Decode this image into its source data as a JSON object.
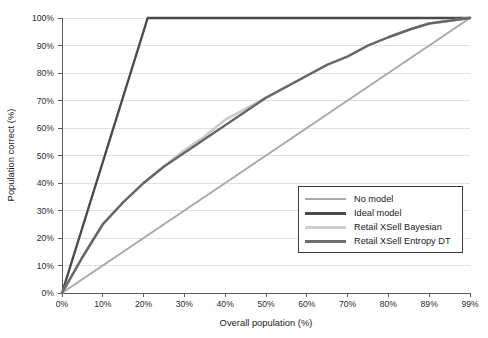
{
  "chart_data": {
    "type": "line",
    "title": "",
    "xlabel": "Overall population (%)",
    "ylabel": "Population correct (%)",
    "xlim": [
      0,
      99
    ],
    "ylim": [
      0,
      100
    ],
    "grid": "horizontal",
    "legend_position": "lower-right",
    "x_tick_labels": [
      "0%",
      "10%",
      "20%",
      "30%",
      "40%",
      "50%",
      "60%",
      "70%",
      "80%",
      "89%",
      "99%"
    ],
    "x_tick_values": [
      0,
      10,
      20,
      30,
      40,
      50,
      60,
      70,
      80,
      89,
      99
    ],
    "y_tick_labels": [
      "0%",
      "10%",
      "20%",
      "30%",
      "40%",
      "50%",
      "60%",
      "70%",
      "80%",
      "90%",
      "100%"
    ],
    "y_tick_values": [
      0,
      10,
      20,
      30,
      40,
      50,
      60,
      70,
      80,
      90,
      100
    ],
    "series": [
      {
        "name": "No model",
        "color": "#a8a8a8",
        "width": 2.0,
        "x": [
          0,
          99
        ],
        "values": [
          0,
          100
        ]
      },
      {
        "name": "Ideal model",
        "color": "#4a4a4a",
        "width": 2.4,
        "x": [
          0,
          21,
          99
        ],
        "values": [
          0,
          100,
          100
        ]
      },
      {
        "name": "Retail XSell Bayesian",
        "color": "#cccccc",
        "width": 2.6,
        "x": [
          0,
          5,
          10,
          15,
          20,
          25,
          30,
          35,
          40,
          45,
          50,
          55,
          60,
          65,
          70,
          75,
          80,
          85,
          89,
          94,
          99
        ],
        "values": [
          0,
          13,
          25,
          33,
          40,
          46,
          52,
          57,
          63,
          67,
          71,
          75,
          79,
          83,
          86,
          90,
          93,
          96,
          98,
          99,
          100
        ]
      },
      {
        "name": "Retail XSell Entropy DT",
        "color": "#666666",
        "width": 2.4,
        "x": [
          0,
          5,
          10,
          15,
          20,
          25,
          30,
          35,
          40,
          45,
          50,
          55,
          60,
          65,
          70,
          75,
          80,
          85,
          89,
          94,
          99
        ],
        "values": [
          0,
          13,
          25,
          33,
          40,
          46,
          51,
          56,
          61,
          66,
          71,
          75,
          79,
          83,
          86,
          90,
          93,
          96,
          98,
          99,
          100
        ]
      }
    ]
  },
  "legend": {
    "items": [
      {
        "label": "No model",
        "color": "#a8a8a8",
        "width": "2px"
      },
      {
        "label": "Ideal model",
        "color": "#4a4a4a",
        "width": "3px"
      },
      {
        "label": "Retail XSell Bayesian",
        "color": "#cfcfcf",
        "width": "3px"
      },
      {
        "label": "Retail XSell Entropy DT",
        "color": "#6e6e6e",
        "width": "3px"
      }
    ]
  },
  "axes": {
    "x_title": "Overall population (%)",
    "y_title": "Population correct (%)"
  }
}
